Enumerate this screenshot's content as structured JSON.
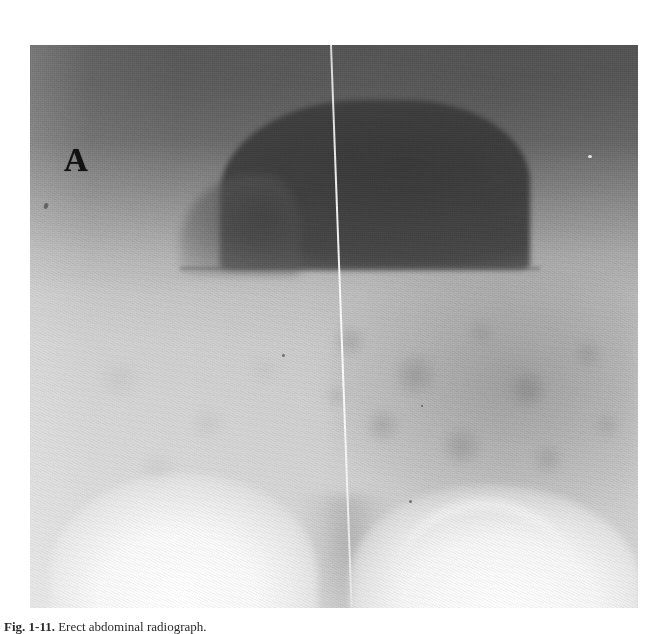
{
  "figure": {
    "panel_label": "A",
    "caption_prefix": "Fig. 1-11.",
    "caption_text": "Erect abdominal radiograph.",
    "image_kind": "abdominal-radiograph",
    "colors": {
      "film_dark": "#565656",
      "film_midtone": "#9b9b9b",
      "film_light": "#dcdcdc",
      "gas_bubble": "#4a4a4a",
      "bright_mass": "#f2f2f2",
      "label_ink": "#121212",
      "line_artifact": "#ffffff",
      "page_background": "#ffffff"
    },
    "plate": {
      "left": 30,
      "top": 45,
      "width": 608,
      "height": 563
    },
    "features": [
      {
        "name": "gas-filled-viscus",
        "description": "large dark gas collection, upper mid-right"
      },
      {
        "name": "air-fluid-level",
        "description": "flat horizontal interface beneath the gas collection"
      },
      {
        "name": "bowel-gas-pattern",
        "description": "mottled lucencies in the right hemiabdomen"
      },
      {
        "name": "bright-mass-left",
        "description": "dense rounded opacity, lower left"
      },
      {
        "name": "bright-mass-right",
        "description": "dense rounded opacity, lower right"
      },
      {
        "name": "line-artifact",
        "description": "thin bright vertical scan line"
      }
    ]
  }
}
